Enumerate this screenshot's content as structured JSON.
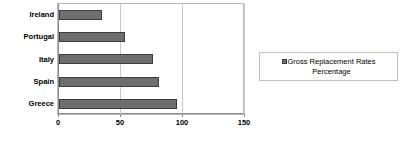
{
  "chart_data": {
    "type": "bar",
    "orientation": "horizontal",
    "title": "",
    "subtitle": "",
    "xlabel": "",
    "ylabel": "",
    "categories": [
      "Greece",
      "Spain",
      "Italy",
      "Portugal",
      "Ireland"
    ],
    "values": [
      95,
      81,
      76,
      53,
      35
    ],
    "series": [
      {
        "name": "Gross Replacement Rates Percentage",
        "values": [
          95,
          81,
          76,
          53,
          35
        ]
      }
    ],
    "xlim": [
      0,
      150
    ],
    "xticks": [
      0,
      50,
      100,
      150
    ],
    "xtick_labels": [
      "0",
      "50",
      "100",
      "150"
    ],
    "grid": "vertical",
    "legend_position": "right",
    "legend_entries": [
      "Gross Replacement Rates Percentage"
    ],
    "bar_color": "#6e6e6e",
    "bar_border_color": "#3d3d3d",
    "plot_border_color": "#b9b9b9",
    "gridline_color": "#c9c9c9",
    "axis_color": "#8a8a8a"
  },
  "legend": {
    "label": "Gross Replacement Rates\nPercentage"
  }
}
